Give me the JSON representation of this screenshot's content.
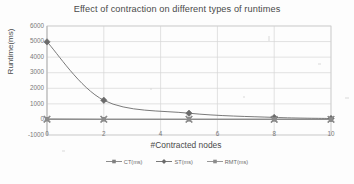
{
  "chart_data": {
    "type": "line",
    "title": "Effect of contraction on different types of runtimes",
    "xlabel": "#Contracted nodes",
    "ylabel": "Runtime(ms)",
    "x": [
      0,
      2,
      5,
      8,
      10
    ],
    "xlim": [
      0,
      10
    ],
    "ylim": [
      -1000,
      6000
    ],
    "xticks": [
      "0",
      "2",
      "4",
      "6",
      "8",
      "10"
    ],
    "yticks": [
      "6000",
      "5000",
      "4000",
      "3000",
      "2000",
      "1000",
      "0",
      "-1000"
    ],
    "grid": "horizontal-and-vertical",
    "legend_position": "bottom",
    "series": [
      {
        "name": "CT(ms)",
        "marker": "square",
        "color": "#808080",
        "values": [
          20,
          15,
          12,
          10,
          8
        ]
      },
      {
        "name": "ST(ms)",
        "marker": "diamond",
        "color": "#6b6b6b",
        "values": [
          4980,
          1230,
          400,
          130,
          60
        ]
      },
      {
        "name": "RMT(ms)",
        "marker": "square",
        "color": "#8c8c8c",
        "values": [
          10,
          8,
          6,
          5,
          4
        ]
      }
    ]
  },
  "legend": {
    "items": [
      {
        "label": "CT(ms)"
      },
      {
        "label": "ST(ms)"
      },
      {
        "label": "RMT(ms)"
      }
    ]
  }
}
